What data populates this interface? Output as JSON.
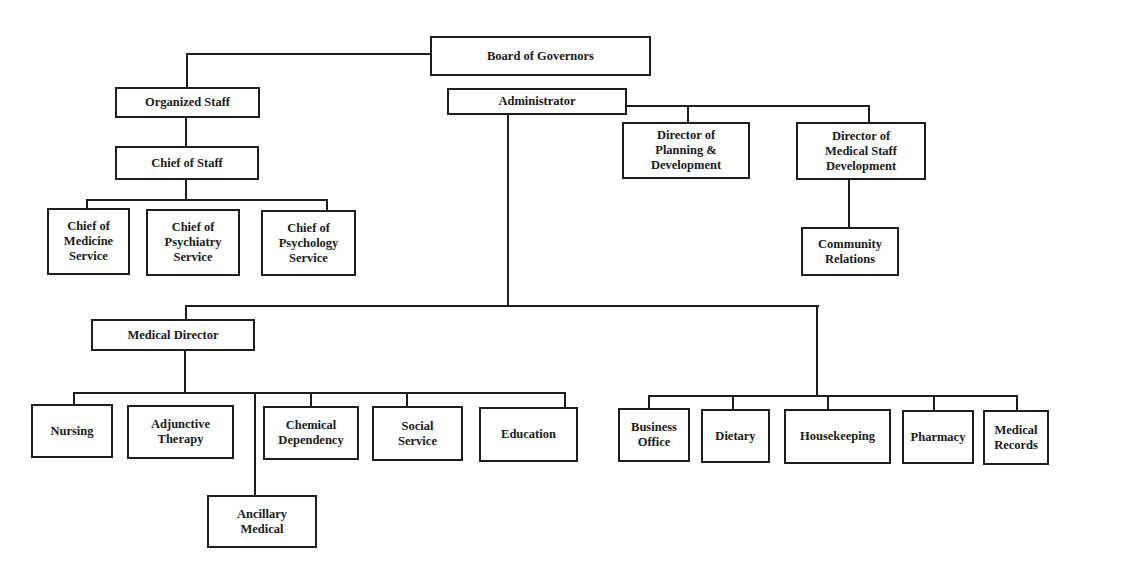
{
  "diagram": {
    "type": "organizational-chart",
    "nodes": {
      "board": "Board of Governors",
      "organized_staff": "Organized Staff",
      "administrator": "Administrator",
      "chief_of_staff": "Chief of Staff",
      "chief_medicine": "Chief of\nMedicine\nService",
      "chief_psychiatry": "Chief of\nPsychiatry\nService",
      "chief_psychology": "Chief of\nPsychology\nService",
      "dir_planning": "Director of\nPlanning &\nDevelopment",
      "dir_med_staff": "Director of\nMedical Staff\nDevelopment",
      "community_relations": "Community\nRelations",
      "medical_director": "Medical Director",
      "nursing": "Nursing",
      "adjunctive_therapy": "Adjunctive\nTherapy",
      "chemical_dependency": "Chemical\nDependency",
      "social_service": "Social\nService",
      "education": "Education",
      "ancillary_medical": "Ancillary\nMedical",
      "business_office": "Business\nOffice",
      "dietary": "Dietary",
      "housekeeping": "Housekeeping",
      "pharmacy": "Pharmacy",
      "medical_records": "Medical\nRecords"
    },
    "edges": [
      [
        "Board of Governors",
        "Organized Staff"
      ],
      [
        "Board of Governors",
        "Administrator"
      ],
      [
        "Organized Staff",
        "Chief of Staff"
      ],
      [
        "Chief of Staff",
        "Chief of Medicine Service"
      ],
      [
        "Chief of Staff",
        "Chief of Psychiatry Service"
      ],
      [
        "Chief of Staff",
        "Chief of Psychology Service"
      ],
      [
        "Administrator",
        "Director of Planning & Development"
      ],
      [
        "Administrator",
        "Director of Medical Staff Development"
      ],
      [
        "Director of Medical Staff Development",
        "Community Relations"
      ],
      [
        "Administrator",
        "Medical Director"
      ],
      [
        "Medical Director",
        "Nursing"
      ],
      [
        "Medical Director",
        "Adjunctive Therapy"
      ],
      [
        "Medical Director",
        "Ancillary Medical"
      ],
      [
        "Medical Director",
        "Chemical Dependency"
      ],
      [
        "Medical Director",
        "Social Service"
      ],
      [
        "Medical Director",
        "Education"
      ],
      [
        "Administrator",
        "Business Office"
      ],
      [
        "Administrator",
        "Dietary"
      ],
      [
        "Administrator",
        "Housekeeping"
      ],
      [
        "Administrator",
        "Pharmacy"
      ],
      [
        "Administrator",
        "Medical Records"
      ]
    ],
    "colors": {
      "line": "#1e1e1e",
      "background": "#ffffff",
      "text": "#1a1a1a"
    }
  },
  "caption": ""
}
